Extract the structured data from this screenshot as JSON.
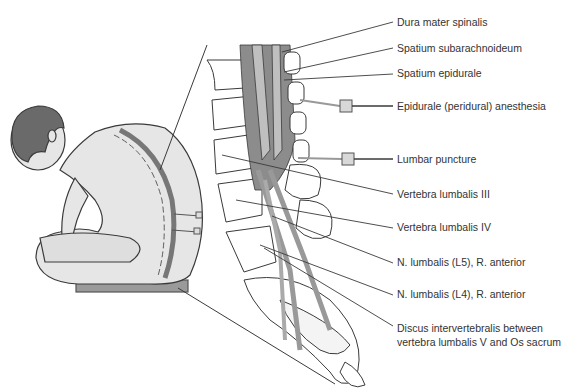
{
  "figure": {
    "colors": {
      "line": "#3a3a3a",
      "skin": "#e4e4e4",
      "hair": "#6a6a6a",
      "dura": "#8c8c8c",
      "nerve": "#b4b4b4",
      "vertebra": "#ffffff",
      "seat": "#9a9a9a"
    }
  },
  "labels": [
    {
      "id": "dura",
      "text": "Dura mater spinalis",
      "x": 397,
      "y": 16
    },
    {
      "id": "subarach",
      "text": "Spatium subarachnoideum",
      "x": 397,
      "y": 42
    },
    {
      "id": "epidural-space",
      "text": "Spatium epidurale",
      "x": 397,
      "y": 67
    },
    {
      "id": "epidural-anesthesia",
      "text": "Epidurale (peridural) anesthesia",
      "x": 397,
      "y": 100
    },
    {
      "id": "lumbar-puncture",
      "text": "Lumbar puncture",
      "x": 397,
      "y": 155
    },
    {
      "id": "l3",
      "text": "Vertebra lumbalis III",
      "x": 397,
      "y": 189
    },
    {
      "id": "l4",
      "text": "Vertebra lumbalis IV",
      "x": 397,
      "y": 222
    },
    {
      "id": "l5-nerve",
      "text": "N. lumbalis (L5), R. anterior",
      "x": 397,
      "y": 257
    },
    {
      "id": "l4-nerve",
      "text": "N. lumbalis (L4), R. anterior",
      "x": 397,
      "y": 289
    },
    {
      "id": "disc-1",
      "text": "Discus intervertebralis between",
      "x": 397,
      "y": 323
    },
    {
      "id": "disc-2",
      "text": "vertebra lumbalis V and Os sacrum",
      "x": 397,
      "y": 337
    }
  ]
}
